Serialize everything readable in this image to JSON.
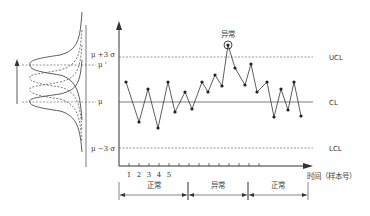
{
  "diagram": {
    "type": "control-chart",
    "left_panel": {
      "labels": {
        "mu_plus_3sigma": "μ +3 σ",
        "mu_prime": "μ '",
        "mu": "μ",
        "mu_minus_3sigma": "μ −3 σ"
      }
    },
    "limit_labels": {
      "ucl": "UCL",
      "cl": "CL",
      "lcl": "LCL"
    },
    "anomaly_label": "异常",
    "x_axis_label": "时间（样本号）",
    "x_tick_labels": [
      "1",
      "2",
      "3",
      "4",
      "5"
    ],
    "segments": [
      {
        "label": "正常",
        "x1": 119,
        "x2": 188
      },
      {
        "label": "异常",
        "x1": 188,
        "x2": 248
      },
      {
        "label": "正常",
        "x1": 248,
        "x2": 308
      }
    ]
  },
  "chart_data": {
    "type": "line",
    "title": "",
    "xlabel": "时间（样本号）",
    "ylabel": "",
    "limits": {
      "UCL": 57,
      "CL": 102,
      "LCL": 148
    },
    "points_px": [
      [
        126,
        82
      ],
      [
        139,
        122
      ],
      [
        148,
        89
      ],
      [
        158,
        128
      ],
      [
        168,
        82
      ],
      [
        175,
        112
      ],
      [
        185,
        92
      ],
      [
        192,
        109
      ],
      [
        202,
        82
      ],
      [
        208,
        92
      ],
      [
        215,
        75
      ],
      [
        222,
        86
      ],
      [
        228,
        45
      ],
      [
        235,
        68
      ],
      [
        245,
        85
      ],
      [
        251,
        64
      ],
      [
        257,
        92
      ],
      [
        267,
        82
      ],
      [
        274,
        117
      ],
      [
        281,
        89
      ],
      [
        288,
        110
      ],
      [
        294,
        82
      ],
      [
        301,
        116
      ]
    ],
    "anomaly_index": 12
  },
  "colors": {
    "line": "#333333",
    "dash": "#555555",
    "text": "#333333"
  }
}
